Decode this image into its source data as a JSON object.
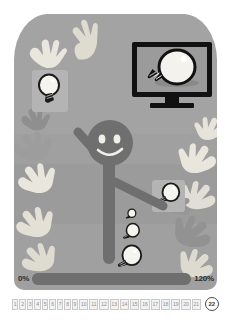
{
  "slide": {
    "background_color": "#a0a0a0",
    "page_background": "#ffffff"
  },
  "monitor": {
    "name": "monitor-with-lightbulb",
    "bezel_color": "#111111",
    "screen_color": "#9b9b9b",
    "content_icon": "lightbulb-icon"
  },
  "figure": {
    "name": "stick-figure-person",
    "color": "#6f6f6f",
    "expression": "smiling",
    "raised_arm": "left"
  },
  "bulbs": [
    {
      "id": "bulb-held-upper-left",
      "size": "medium",
      "has_tile": true
    },
    {
      "id": "bulb-held-right-hand",
      "size": "medium",
      "has_tile": true
    },
    {
      "id": "bulb-tiny",
      "size": "tiny",
      "has_tile": false
    },
    {
      "id": "bulb-small",
      "size": "small",
      "has_tile": false
    },
    {
      "id": "bulb-large",
      "size": "large",
      "has_tile": false
    }
  ],
  "hands": {
    "name": "reaching-hands",
    "count": 13,
    "light_color": "#e8e6dd",
    "mid_color": "#c9c6bc",
    "dark_color": "#8e8e8e"
  },
  "progress": {
    "start_label": "0%",
    "end_label": "120%",
    "fill_percent": 100,
    "track_color": "#7b7b7b",
    "fill_color": "#6f6f6f"
  },
  "page_strip": {
    "pages": [
      "1",
      "2",
      "3",
      "4",
      "5",
      "6",
      "7",
      "8",
      "9",
      "10",
      "11",
      "12",
      "13",
      "14",
      "15",
      "16",
      "17",
      "18",
      "19",
      "20",
      "21"
    ],
    "current_page": "22"
  }
}
